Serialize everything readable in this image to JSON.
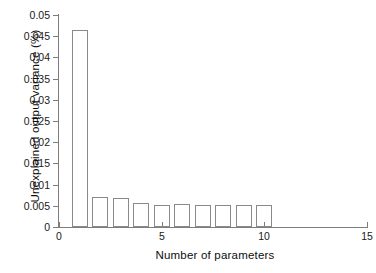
{
  "chart_data": {
    "type": "bar",
    "title": "",
    "xlabel": "Number of parameters",
    "ylabel": "Unexplained output variance (%)",
    "xlim": [
      0,
      15
    ],
    "ylim": [
      0,
      0.05
    ],
    "grid": false,
    "legend": null,
    "xticks": [
      0,
      5,
      10,
      15
    ],
    "xtick_labels": [
      "0",
      "5",
      "10",
      "15"
    ],
    "yticks": [
      0,
      0.005,
      0.01,
      0.015,
      0.02,
      0.025,
      0.03,
      0.035,
      0.04,
      0.045,
      0.05
    ],
    "ytick_labels": [
      "0",
      "0.005",
      "0.01",
      "0.015",
      "0.02",
      "0.025",
      "0.03",
      "0.035",
      "0.04",
      "0.045",
      "0.05"
    ],
    "bar_style": "open-outline",
    "bar_edge_color": "#8a8a8a",
    "bar_fill_color": "none",
    "axis_color": "#7d7d7d",
    "categories": [
      1,
      2,
      3,
      4,
      5,
      6,
      7,
      8,
      9,
      10
    ],
    "values": [
      0.0465,
      0.007,
      0.0069,
      0.0057,
      0.0053,
      0.0054,
      0.0053,
      0.0052,
      0.0052,
      0.0052
    ]
  }
}
